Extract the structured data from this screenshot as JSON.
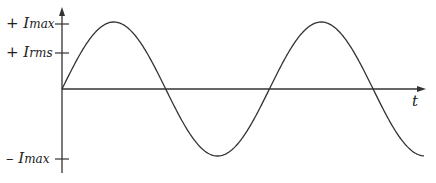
{
  "diagram": {
    "title": "",
    "axes": {
      "x_label": "t",
      "y_ticks": [
        {
          "sign": "+",
          "symbol": "I",
          "subscript": "max",
          "y": 24
        },
        {
          "sign": "+",
          "symbol": "I",
          "subscript": "rms",
          "y": 53
        },
        {
          "sign": "–",
          "symbol": "I",
          "subscript": "max",
          "y": 159
        }
      ]
    },
    "colors": {
      "stroke": "#333333",
      "background": "#ffffff"
    }
  },
  "chart_data": {
    "type": "line",
    "title": "",
    "xlabel": "t",
    "ylabel": "",
    "y_tick_labels": [
      "+ Imax",
      "+ Irms",
      "– Imax"
    ],
    "series": [
      {
        "name": "I(t)",
        "function": "Imax*sin(wt)",
        "cycles_shown": 1.75
      }
    ],
    "key_points": [
      {
        "phase": "0",
        "value": "0"
      },
      {
        "phase": "π/2",
        "value": "+Imax"
      },
      {
        "phase": "π",
        "value": "0"
      },
      {
        "phase": "3π/2",
        "value": "-Imax"
      },
      {
        "phase": "2π",
        "value": "0"
      },
      {
        "phase": "5π/2",
        "value": "+Imax"
      },
      {
        "phase": "3π",
        "value": "0"
      },
      {
        "phase": "7π/2",
        "value": "-Imax"
      }
    ],
    "grid": false
  }
}
